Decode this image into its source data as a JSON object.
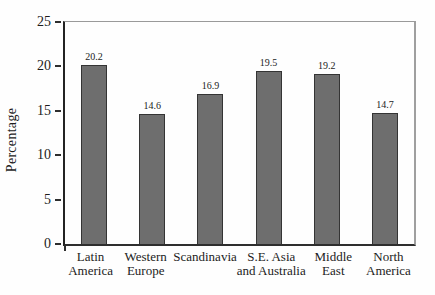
{
  "chart_data": {
    "type": "bar",
    "categories": [
      "Latin\nAmerica",
      "Western\nEurope",
      "Scandinavia",
      "S.E. Asia\nand Australia",
      "Middle\nEast",
      "North\nAmerica"
    ],
    "values": [
      20.2,
      14.6,
      16.9,
      19.5,
      19.2,
      14.7
    ],
    "value_labels": [
      "20.2",
      "14.6",
      "16.9",
      "19.5",
      "19.2",
      "14.7"
    ],
    "title": "",
    "xlabel": "",
    "ylabel": "Percentage",
    "ylim": [
      0,
      25
    ],
    "yticks": [
      0,
      5,
      10,
      15,
      20,
      25
    ],
    "grid": false,
    "legend": "none",
    "colors": {
      "bar_fill": "#6e6e6e",
      "bar_border": "#343434",
      "axis": "#2e2e2e",
      "frame": "#9a9a9a",
      "text": "#1c1c1c",
      "background": "#fefefe"
    }
  }
}
